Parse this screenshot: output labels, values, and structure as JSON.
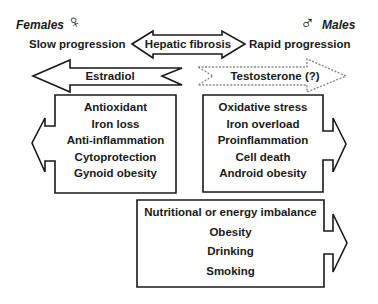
{
  "header": {
    "female_label": "Females",
    "female_symbol": "♀",
    "male_label": "Males",
    "male_symbol": "♂"
  },
  "progression": {
    "left": "Slow progression",
    "center": "Hepatic fibrosis",
    "right": "Rapid progression"
  },
  "hormones": {
    "female": "Estradiol",
    "male": "Testosterone (?)"
  },
  "female_effects": {
    "items": [
      "Antioxidant",
      "Iron loss",
      "Anti-inflammation",
      "Cytoprotection",
      "Gynoid obesity"
    ]
  },
  "male_effects": {
    "items": [
      "Oxidative stress",
      "Iron overload",
      "Proinflammation",
      "Cell death",
      "Android obesity"
    ]
  },
  "risk_factors": {
    "items": [
      "Nutritional or energy imbalance",
      "Obesity",
      "Drinking",
      "Smoking"
    ]
  },
  "colors": {
    "stroke": "#1a1a1a",
    "dotted_stroke": "#8a8a8a",
    "background": "#ffffff"
  }
}
